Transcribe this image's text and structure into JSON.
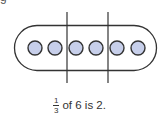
{
  "header": {
    "cutoff_text": "g"
  },
  "diagram": {
    "total_items": 6,
    "groups": 3,
    "items_per_group": 2,
    "colors": {
      "circle_fill": "#c7cfea",
      "stroke": "#333333"
    }
  },
  "caption": {
    "fraction_numerator": "1",
    "fraction_denominator": "3",
    "text": "of 6 is 2."
  }
}
